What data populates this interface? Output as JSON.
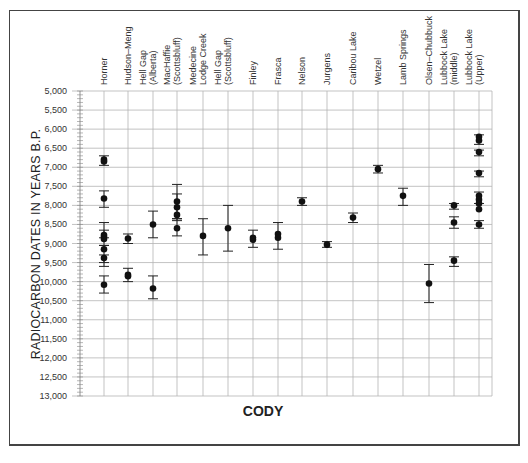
{
  "chart_data": {
    "type": "scatter",
    "subtype": "dot-with-error-bars",
    "title": "",
    "xlabel": "CODY",
    "ylabel": "RADIOCARBON DATES IN YEARS B.P.",
    "ylim": [
      5000,
      13000
    ],
    "y_inverted": true,
    "y_ticks": [
      "5,000",
      "5,500",
      "6,000",
      "6,500",
      "7,000",
      "7,500",
      "8,000",
      "8,500",
      "9,000",
      "9,500",
      "10,000",
      "10,500",
      "11,000",
      "11,500",
      "12,000",
      "12,500",
      "13,000"
    ],
    "y_tick_values": [
      5000,
      5500,
      6000,
      6500,
      7000,
      7500,
      8000,
      8500,
      9000,
      9500,
      10000,
      10500,
      11000,
      11500,
      12000,
      12500,
      13000
    ],
    "grid": true,
    "legend": null,
    "categories": [
      {
        "label": [
          "Horner"
        ],
        "x": 104
      },
      {
        "label": [
          "Hudson–Meng"
        ],
        "x": 128
      },
      {
        "label": [
          "Hell  Gap",
          "(Alberta)"
        ],
        "x": 153
      },
      {
        "label": [
          "MacHaffie",
          "(Scottsbluff)"
        ],
        "x": 177
      },
      {
        "label": [
          "Medecine",
          "Lodge  Creek"
        ],
        "x": 203
      },
      {
        "label": [
          "Hell  Gap",
          "(Scottsbluff)"
        ],
        "x": 228
      },
      {
        "label": [
          "Finley"
        ],
        "x": 253
      },
      {
        "label": [
          "Frasca"
        ],
        "x": 278
      },
      {
        "label": [
          "Nelson"
        ],
        "x": 302
      },
      {
        "label": [
          "Jurgens"
        ],
        "x": 327
      },
      {
        "label": [
          "Caribou Lake"
        ],
        "x": 353
      },
      {
        "label": [
          "Wetzel"
        ],
        "x": 378
      },
      {
        "label": [
          "Lamb Springs"
        ],
        "x": 403
      },
      {
        "label": [
          "Olsen–Chubbuck"
        ],
        "x": 429
      },
      {
        "label": [
          "Lubbock Lake",
          "(middle)"
        ],
        "x": 454
      },
      {
        "label": [
          "Lubbock Lake",
          "(Upper)"
        ],
        "x": 479
      }
    ],
    "series": [
      {
        "site": "Horner",
        "points": [
          6800,
          6850,
          7820,
          8780,
          8830,
          8880,
          9150,
          9380,
          10080
        ],
        "error_bars": [
          [
            6700,
            6950
          ],
          [
            7620,
            8050
          ],
          [
            8450,
            8850
          ],
          [
            8650,
            9050
          ],
          [
            9050,
            9500
          ],
          [
            9300,
            9600
          ],
          [
            9850,
            10300
          ]
        ]
      },
      {
        "site": "Hudson–Meng",
        "points": [
          8870,
          9820,
          9860
        ],
        "error_bars": [
          [
            8750,
            9000
          ],
          [
            9650,
            10000
          ]
        ]
      },
      {
        "site": "Hell Gap (Alberta)",
        "points": [
          8500,
          10180
        ],
        "error_bars": [
          [
            8150,
            8850
          ],
          [
            9850,
            10450
          ]
        ]
      },
      {
        "site": "MacHaffie (Scottsbluff)",
        "points": [
          7900,
          8050,
          8250,
          8600
        ],
        "error_bars": [
          [
            7450,
            8350
          ],
          [
            7700,
            8400
          ],
          [
            8350,
            8800
          ]
        ]
      },
      {
        "site": "Medecine Lodge Creek",
        "points": [
          8800
        ],
        "error_bars": [
          [
            8350,
            9300
          ]
        ]
      },
      {
        "site": "Hell Gap (Scottsbluff)",
        "points": [
          8600
        ],
        "error_bars": [
          [
            8000,
            9200
          ]
        ]
      },
      {
        "site": "Finley",
        "points": [
          8850,
          8900
        ],
        "error_bars": [
          [
            8650,
            9100
          ]
        ]
      },
      {
        "site": "Frasca",
        "points": [
          8750,
          8850
        ],
        "error_bars": [
          [
            8450,
            9150
          ]
        ]
      },
      {
        "site": "Nelson",
        "points": [
          7900
        ],
        "error_bars": [
          [
            7800,
            8000
          ]
        ]
      },
      {
        "site": "Jurgens",
        "points": [
          9030
        ],
        "error_bars": [
          [
            8950,
            9100
          ]
        ]
      },
      {
        "site": "Caribou Lake",
        "points": [
          8320
        ],
        "error_bars": [
          [
            8200,
            8450
          ]
        ]
      },
      {
        "site": "Wetzel",
        "points": [
          7050
        ],
        "error_bars": [
          [
            6950,
            7150
          ]
        ]
      },
      {
        "site": "Lamb Springs",
        "points": [
          7750
        ],
        "error_bars": [
          [
            7550,
            8000
          ]
        ]
      },
      {
        "site": "Olsen–Chubbuck",
        "points": [
          10050
        ],
        "error_bars": [
          [
            9550,
            10550
          ]
        ]
      },
      {
        "site": "Lubbock Lake (middle)",
        "points": [
          8000,
          8450,
          9450
        ],
        "error_bars": [
          [
            7950,
            8100
          ],
          [
            8300,
            8600
          ],
          [
            9350,
            9600
          ]
        ]
      },
      {
        "site": "Lubbock Lake (Upper)",
        "points": [
          6200,
          6300,
          6600,
          7150,
          7750,
          7850,
          7950,
          8100,
          8500
        ],
        "error_bars": [
          [
            6150,
            6400
          ],
          [
            6550,
            6700
          ],
          [
            7100,
            7250
          ],
          [
            7650,
            7950
          ],
          [
            8400,
            8600
          ]
        ]
      }
    ]
  },
  "labels": {
    "ylabel": "RADIOCARBON DATES IN YEARS B.P.",
    "xtitle": "CODY"
  },
  "colors": {
    "frame": "#444444",
    "grid": "#b4b4b4",
    "point": "#111111",
    "text": "#222222"
  }
}
